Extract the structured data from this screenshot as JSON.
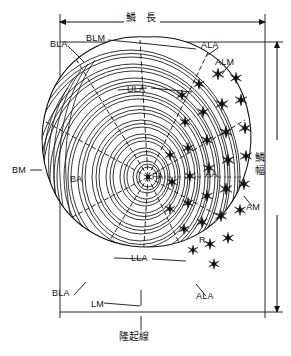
{
  "figure": {
    "kind": "fish-scale-anatomy-diagram",
    "caption_top": "鱗　長",
    "caption_right": "鱗幅",
    "caption_bottom": "隆起線",
    "ink_color": "#111111",
    "background_color": "#ffffff"
  },
  "dimensions": {
    "length": {
      "label": "鱗　長",
      "orientation": "horizontal",
      "arrow": "double"
    },
    "width": {
      "label": "鱗幅",
      "orientation": "vertical",
      "arrow": "double"
    }
  },
  "annotations": [
    {
      "id": "BLA-top",
      "text": "BLA",
      "x": 50,
      "y": 40
    },
    {
      "id": "BLM",
      "text": "BLM",
      "x": 86,
      "y": 34
    },
    {
      "id": "ALA-top",
      "text": "ALA",
      "x": 201,
      "y": 41
    },
    {
      "id": "ALM",
      "text": "ALM",
      "x": 215,
      "y": 58
    },
    {
      "id": "ULA",
      "text": "ULA",
      "x": 127,
      "y": 85
    },
    {
      "id": "BM",
      "text": "BM",
      "x": 12,
      "y": 166
    },
    {
      "id": "BA",
      "text": "BA",
      "x": 70,
      "y": 175
    },
    {
      "id": "FA",
      "text": "FA",
      "x": 152,
      "y": 172
    },
    {
      "id": "AA",
      "text": "AA",
      "x": 205,
      "y": 170
    },
    {
      "id": "AM",
      "text": "AM",
      "x": 246,
      "y": 203
    },
    {
      "id": "R",
      "text": "R",
      "x": 199,
      "y": 236
    },
    {
      "id": "LLA",
      "text": "LLA",
      "x": 131,
      "y": 254
    },
    {
      "id": "BLA-bot",
      "text": "BLA",
      "x": 52,
      "y": 289
    },
    {
      "id": "LM",
      "text": "LM",
      "x": 91,
      "y": 300
    },
    {
      "id": "ALA-bot",
      "text": "ALA",
      "x": 196,
      "y": 292
    }
  ],
  "features": {
    "focus_marker": "dot-at-center",
    "circuli": "concentric-wavy-rings",
    "radii": "radial-lines-from-focus",
    "ctenii": "black-star-spines-on-posterior-field"
  }
}
